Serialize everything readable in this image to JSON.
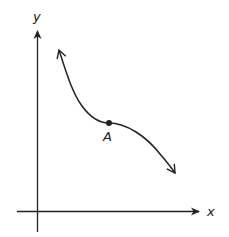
{
  "diagram": {
    "type": "function-graph",
    "axes": {
      "x_label": "x",
      "y_label": "y"
    },
    "curve": {
      "description": "Decreasing curve with an inflection point at A",
      "direction": "decreasing",
      "arrows_both_ends": true
    },
    "points": [
      {
        "label": "A",
        "role": "inflection point"
      }
    ],
    "colors": {
      "stroke": "#222222",
      "background": "#ffffff"
    }
  }
}
